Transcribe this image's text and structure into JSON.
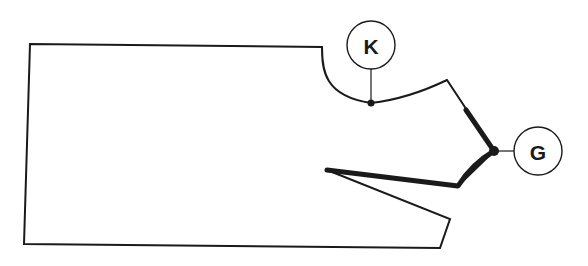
{
  "diagram": {
    "type": "pattern-piece",
    "colors": {
      "line": "#1a1a1a",
      "background": "#ffffff"
    },
    "callouts": [
      {
        "id": "K",
        "label": "K",
        "target": "neckline point"
      },
      {
        "id": "G",
        "label": "G",
        "target": "gorge / lapel notch point"
      }
    ]
  }
}
